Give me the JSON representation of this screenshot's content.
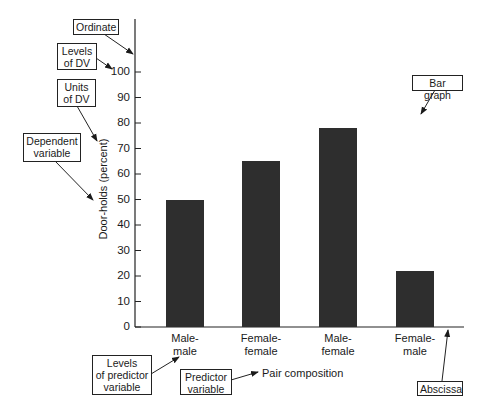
{
  "chart_data": {
    "type": "bar",
    "title": "",
    "xlabel": "Pair composition",
    "ylabel": "Door-holds (percent)",
    "categories": [
      "Male-\nmale",
      "Female-\nfemale",
      "Male-\nfemale",
      "Female-\nmale"
    ],
    "values": [
      50,
      65,
      78,
      22
    ],
    "ylim": [
      0,
      100
    ],
    "yticks": [
      0,
      10,
      20,
      30,
      40,
      50,
      60,
      70,
      80,
      90,
      100
    ],
    "grid": false,
    "legend": null,
    "bar_color": "#2e2e2e",
    "annotations": [
      {
        "id": "ordinate",
        "text": "Ordinate"
      },
      {
        "id": "levels-dv",
        "text": "Levels\nof DV"
      },
      {
        "id": "units-dv",
        "text": "Units\nof DV"
      },
      {
        "id": "dependent-variable",
        "text": "Dependent\nvariable"
      },
      {
        "id": "bar-graph",
        "text": "Bar graph"
      },
      {
        "id": "levels-predictor",
        "text": "Levels\nof predictor\nvariable"
      },
      {
        "id": "predictor-variable",
        "text": "Predictor\nvariable"
      },
      {
        "id": "abscissa",
        "text": "Abscissa"
      }
    ]
  },
  "labels": {
    "ordinate": "Ordinate",
    "levels_dv": "Levels\nof DV",
    "units_dv": "Units\nof DV",
    "dependent_variable": "Dependent\nvariable",
    "bar_graph": "Bar graph",
    "levels_predictor": "Levels\nof predictor\nvariable",
    "predictor_variable": "Predictor\nvariable",
    "abscissa": "Abscissa"
  }
}
